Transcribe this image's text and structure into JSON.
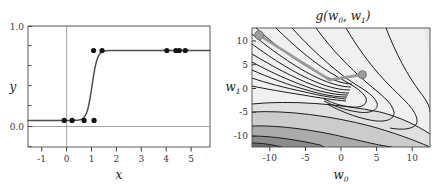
{
  "figure": {
    "background_color": "#ffffff",
    "panels": [
      "classification-fit",
      "cost-surface"
    ]
  },
  "chart_data": [
    {
      "id": "classification-fit",
      "type": "scatter",
      "title": "",
      "xlabel": "x",
      "ylabel": "y",
      "xlim": [
        -1.55,
        5.75
      ],
      "ylim": [
        -0.38,
        1.35
      ],
      "xticks": [
        -1,
        0,
        1,
        2,
        3,
        4,
        5
      ],
      "xticklabels": [
        "-1",
        "0",
        "1",
        "2",
        "3",
        "4",
        "5"
      ],
      "yticks": [
        0.0,
        1.0
      ],
      "yticklabels": [
        "0.0",
        "1.0"
      ],
      "grid": false,
      "reference_lines": [
        {
          "name": "upper-dotted",
          "y": 1.0,
          "style": "dotted",
          "color": "#8f8f8f"
        },
        {
          "name": "zero-horizontal",
          "y": 0.0,
          "style": "solid",
          "color": "#8f8f8f"
        },
        {
          "name": "zero-vertical",
          "x": 0.0,
          "style": "solid",
          "color": "#8f8f8f"
        }
      ],
      "points": {
        "name": "training-data",
        "color": "#141414",
        "marker": "circle",
        "x": [
          -0.1,
          0.22,
          0.7,
          1.1,
          1.08,
          1.42,
          4.02,
          4.38,
          4.52,
          4.76
        ],
        "y": [
          0.0,
          0.0,
          0.0,
          0.0,
          1.0,
          1.0,
          1.0,
          1.0,
          1.0,
          1.0
        ]
      },
      "curve": {
        "name": "sigmoid-fit",
        "color": "#4d4d4d",
        "form": "logistic",
        "center": 1.02,
        "steepness": 9.5,
        "lower": 0.0,
        "upper": 1.0
      }
    },
    {
      "id": "cost-surface",
      "type": "heatmap",
      "title": "g(w0, w1)",
      "title_parts": {
        "fn": "g",
        "open": "(",
        "arg0": "w",
        "sub0": "0",
        "comma": ", ",
        "arg1": "w",
        "sub1": "1",
        "close": ")"
      },
      "xlabel": "w0",
      "xlabel_parts": {
        "base": "w",
        "sub": "0"
      },
      "ylabel": "w1",
      "ylabel_parts": {
        "base": "w",
        "sub": "1"
      },
      "xlim": [
        -12.5,
        12.5
      ],
      "ylim": [
        -12.5,
        12.5
      ],
      "xticks": [
        -10,
        -5,
        0,
        5,
        10
      ],
      "xticklabels": [
        "-10",
        "-5",
        "0",
        "5",
        "10"
      ],
      "yticks": [
        -10,
        -5,
        0,
        5,
        10
      ],
      "yticklabels": [
        "-10",
        "-5",
        "0",
        "5",
        "10"
      ],
      "grid": false,
      "contour_colors": [
        "#f0f0f0",
        "#e3e3e3",
        "#d2d2d2",
        "#b9b9b9",
        "#9a9a9a",
        "#7d7d7d",
        "#5f5f5f"
      ],
      "contour_line_color": "#1a1a1a",
      "path": {
        "name": "gradient-descent-path",
        "color": "#9a9a9a",
        "points": [
          [
            -11.5,
            11.0
          ],
          [
            -1.6,
            1.6
          ],
          [
            3.0,
            2.7
          ]
        ],
        "markers": [
          {
            "name": "start-marker",
            "x": -11.5,
            "y": 11.0
          },
          {
            "name": "end-marker",
            "x": 3.0,
            "y": 2.7
          }
        ],
        "marker_color": "#9e9e9e",
        "marker_edge_color": "#6f6f6f"
      }
    }
  ]
}
